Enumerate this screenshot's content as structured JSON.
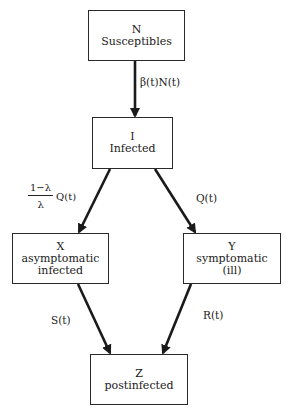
{
  "diagram": {
    "nodes": [
      {
        "id": "N",
        "symbol": "N",
        "lines": [
          "Susceptibles"
        ]
      },
      {
        "id": "I",
        "symbol": "I",
        "lines": [
          "Infected"
        ]
      },
      {
        "id": "X",
        "symbol": "X",
        "lines": [
          "asymptomatic",
          "infected"
        ]
      },
      {
        "id": "Y",
        "symbol": "Y",
        "lines": [
          "symptomatic",
          "(ill)"
        ]
      },
      {
        "id": "Z",
        "symbol": "Z",
        "lines": [
          "postinfected"
        ]
      }
    ],
    "edges": [
      {
        "from": "N",
        "to": "I",
        "label": "β(t)N(t)"
      },
      {
        "from": "I",
        "to": "X",
        "label_numerator": "1−λ",
        "label_denominator": "λ",
        "label_suffix": "Q(t)"
      },
      {
        "from": "I",
        "to": "Y",
        "label": "Q(t)"
      },
      {
        "from": "X",
        "to": "Z",
        "label": "S(t)"
      },
      {
        "from": "Y",
        "to": "Z",
        "label": "R(t)"
      }
    ],
    "colors": {
      "stroke": "#1a1a1a",
      "background": "#ffffff"
    }
  }
}
